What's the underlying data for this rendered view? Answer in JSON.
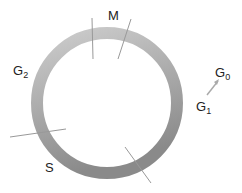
{
  "diagram": {
    "type": "cell-cycle",
    "ring": {
      "cx": 107,
      "cy": 103,
      "r": 70,
      "stroke_width": 12
    },
    "colors": {
      "ring_light": "#c8c8c8",
      "ring_dark": "#8e8e8e",
      "divider": "#999999",
      "text": "#222222"
    },
    "labels": {
      "m": {
        "main": "M",
        "sub": ""
      },
      "g2": {
        "main": "G",
        "sub": "2"
      },
      "g0": {
        "main": "G",
        "sub": "0"
      },
      "g1": {
        "main": "G",
        "sub": "1"
      },
      "s": {
        "main": "S",
        "sub": ""
      }
    }
  }
}
